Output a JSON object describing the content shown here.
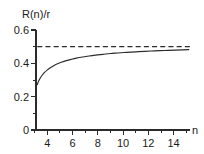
{
  "chart_data": {
    "type": "line",
    "title": "",
    "subtitle": "",
    "ylabel": "R(n)/r",
    "xlabel": "n",
    "xlim": [
      3.0,
      15.2
    ],
    "ylim": [
      0,
      0.6
    ],
    "grid": false,
    "legend": null,
    "x_ticks": [
      4,
      6,
      8,
      10,
      12,
      14
    ],
    "x_tick_labels": [
      "4",
      "6",
      "8",
      "10",
      "12",
      "14"
    ],
    "x_minor_ticks": [
      3,
      5,
      7,
      9,
      11,
      13,
      15
    ],
    "y_ticks": [
      0,
      0.2,
      0.4,
      0.6
    ],
    "y_tick_labels": [
      "0",
      "0.2",
      "0.4",
      "0.6"
    ],
    "y_minor_ticks": [
      0.1,
      0.3,
      0.5
    ],
    "series": [
      {
        "name": "R(n)/r",
        "style": "solid",
        "x": [
          3.1,
          3.2,
          3.35,
          3.5,
          3.7,
          3.9,
          4.1,
          4.4,
          4.7,
          5.0,
          5.4,
          5.8,
          6.2,
          6.7,
          7.2,
          7.7,
          8.3,
          8.9,
          9.5,
          10.2,
          10.9,
          11.6,
          12.4,
          13.2,
          14.0,
          14.6,
          15.1
        ],
        "y": [
          0.272,
          0.292,
          0.313,
          0.33,
          0.347,
          0.361,
          0.372,
          0.386,
          0.397,
          0.406,
          0.416,
          0.424,
          0.431,
          0.438,
          0.444,
          0.449,
          0.454,
          0.459,
          0.462,
          0.466,
          0.469,
          0.472,
          0.475,
          0.477,
          0.479,
          0.481,
          0.482
        ]
      },
      {
        "name": "asymptote",
        "style": "dashed",
        "value": 0.5,
        "x": [
          3.1,
          15.2
        ],
        "y": [
          0.5,
          0.5
        ]
      }
    ],
    "annotations": []
  },
  "labels": {
    "y_axis_title": "R(n)/r",
    "x_axis_title": "n"
  }
}
